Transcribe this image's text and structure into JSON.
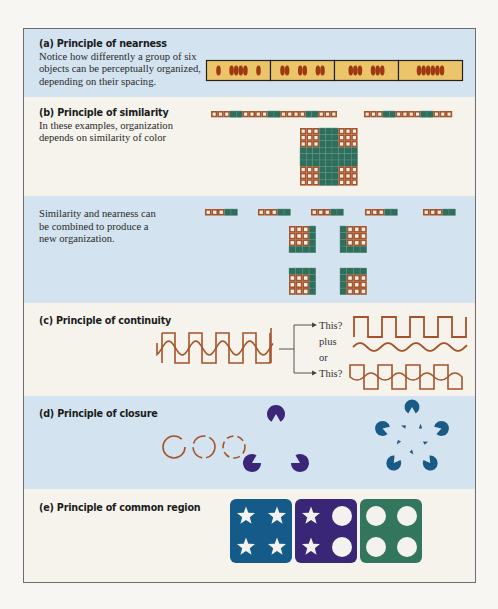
{
  "colors": {
    "frame_border": "#6d6d6d",
    "panel_blue": "#d3e3ef",
    "panel_cream": "#f5f3ec",
    "brown": "#a5532a",
    "green": "#2e6e5a",
    "bar_fill": "#ecc56a",
    "dot": "#9e3a12",
    "purple": "#3b2677",
    "teal_blue": "#1a5a86",
    "region_blue": "#155b8a",
    "region_purple": "#3a2676",
    "region_green": "#33765e"
  },
  "sections": {
    "a": {
      "title": "(a) Principle of nearness",
      "lines": [
        "Notice how differently a group of six",
        "objects can be perceptually organized,",
        "depending on their spacing."
      ],
      "groupings": [
        "1-4-1",
        "2-2-2",
        "3-3",
        "6"
      ]
    },
    "b": {
      "title": "(b) Principle of similarity",
      "lines": [
        "In these examples, organization",
        "depends on similarity of color"
      ],
      "row1_pattern": "oooggooooggooooggooo",
      "row2_pattern": "oooggooooggooo"
    },
    "b2": {
      "lines": [
        "Similarity and nearness can",
        "be combined to produce a",
        "new organization."
      ],
      "row_groups": 5
    },
    "c": {
      "title": "(c) Principle of continuity",
      "options": [
        "This?",
        "plus",
        "or",
        "This?"
      ]
    },
    "d": {
      "title": "(d) Principle of closure"
    },
    "e": {
      "title": "(e) Principle of common region",
      "regions": [
        {
          "color": "region_blue",
          "items": [
            "star",
            "star",
            "star",
            "star"
          ]
        },
        {
          "color": "region_purple",
          "items": [
            "star",
            "circle",
            "star",
            "circle"
          ]
        },
        {
          "color": "region_green",
          "items": [
            "circle",
            "circle",
            "circle",
            "circle"
          ]
        }
      ]
    }
  }
}
